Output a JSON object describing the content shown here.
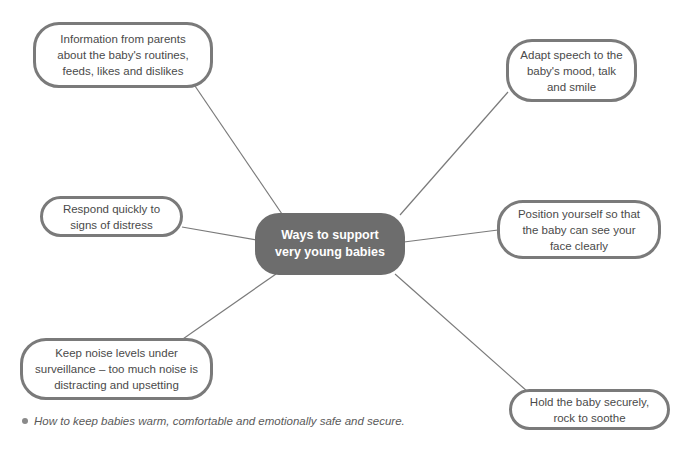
{
  "diagram": {
    "type": "mind-map",
    "center": {
      "id": "center",
      "label": "Ways to support very young babies",
      "fill": "#6d6d6d",
      "text_color": "#ffffff"
    },
    "nodes": [
      {
        "id": "parents-info",
        "label": "Information from parents about the baby's routines, feeds, likes and dislikes",
        "position": "top-left"
      },
      {
        "id": "adapt-speech",
        "label": "Adapt speech to the baby's mood, talk and smile",
        "position": "top-right"
      },
      {
        "id": "respond-distress",
        "label": "Respond quickly to signs of distress",
        "position": "middle-left"
      },
      {
        "id": "position-face",
        "label": "Position yourself so that the baby can see your face clearly",
        "position": "middle-right"
      },
      {
        "id": "noise-levels",
        "label": "Keep noise levels under surveillance – too much noise is distracting and upsetting",
        "position": "bottom-left"
      },
      {
        "id": "hold-securely",
        "label": "Hold the baby securely, rock to soothe",
        "position": "bottom-right"
      }
    ],
    "edges": [
      {
        "from": "center",
        "to": "parents-info"
      },
      {
        "from": "center",
        "to": "adapt-speech"
      },
      {
        "from": "center",
        "to": "respond-distress"
      },
      {
        "from": "center",
        "to": "position-face"
      },
      {
        "from": "center",
        "to": "noise-levels"
      },
      {
        "from": "center",
        "to": "hold-securely"
      }
    ],
    "colors": {
      "node_border": "#7a7a7a",
      "connector": "#7a7a7a",
      "node_text": "#4a4a4a"
    }
  },
  "caption": {
    "text": "How to keep babies warm, comfortable and emotionally safe and secure."
  }
}
